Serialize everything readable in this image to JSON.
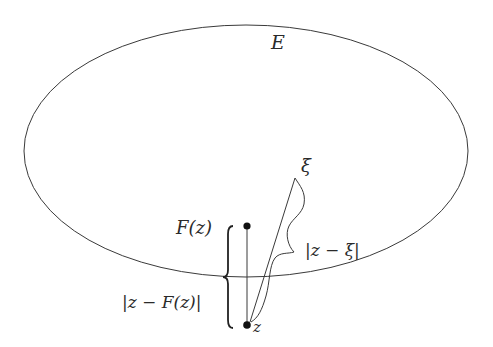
{
  "diagram": {
    "type": "geometric-illustration",
    "colors": {
      "stroke": "#3a3a3a",
      "text": "#2a2a2a",
      "background": "#ffffff",
      "point": "#111111"
    },
    "ellipse": {
      "label": "E",
      "cx": 246,
      "cy": 151,
      "rx": 222,
      "ry": 126
    },
    "points": {
      "z": {
        "label": "z",
        "x": 247,
        "y": 325
      },
      "Fz": {
        "label": "F(z)",
        "x": 247,
        "y": 226
      },
      "xi": {
        "label": "ξ",
        "x": 295,
        "y": 178
      }
    },
    "distances": {
      "z_minus_Fz": {
        "label": "|z − F(z)|"
      },
      "z_minus_xi": {
        "label": "|z − ξ|"
      }
    }
  }
}
